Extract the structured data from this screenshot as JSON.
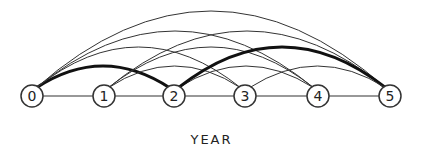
{
  "diagram": {
    "axis_label": "YEAR",
    "nodes": [
      {
        "id": "0",
        "x": 32
      },
      {
        "id": "1",
        "x": 104
      },
      {
        "id": "2",
        "x": 174
      },
      {
        "id": "3",
        "x": 245
      },
      {
        "id": "4",
        "x": 318
      },
      {
        "id": "5",
        "x": 390
      }
    ],
    "baseline_y": 96,
    "node_radius": 11,
    "arc_peak_by_span": {
      "2": 66,
      "3": 47,
      "4": 31,
      "5": 11
    },
    "highlighted_path": [
      "0",
      "2",
      "5"
    ],
    "colors": {
      "line": "#333333",
      "highlight": "#111111",
      "node_fill": "#ffffff"
    }
  }
}
